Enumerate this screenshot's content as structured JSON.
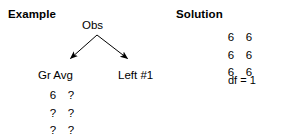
{
  "figure": {
    "background_color": "#ffffff",
    "ink_color": "#000000",
    "width": 281,
    "height": 138
  },
  "example": {
    "heading": "Example",
    "root_node": {
      "label": "Obs"
    },
    "branches": [
      {
        "label": "Gr Avg",
        "direction": "down-left"
      },
      {
        "label": "Left #1",
        "direction": "down-right"
      }
    ],
    "value_grid": {
      "columns": 2,
      "rows": 3,
      "cells": [
        "6",
        "?",
        "?",
        "?",
        "?",
        "?"
      ]
    }
  },
  "solution": {
    "heading": "Solution",
    "value_grid": {
      "columns": 2,
      "rows": 3,
      "cells": [
        "6",
        "6",
        "6",
        "6",
        "6",
        "6"
      ]
    },
    "df_line": "df = 1"
  }
}
